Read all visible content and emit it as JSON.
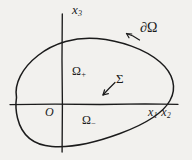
{
  "figure": {
    "kind": "hand-drawn-math-diagram",
    "background_color": "#f2f1ee",
    "ink_color": "#1b1b1b",
    "width": 192,
    "height": 160
  },
  "axes": {
    "vertical": {
      "label": "x",
      "subscript": "3",
      "x": 62,
      "y_top": 14,
      "y_bottom": 152
    },
    "horizontal": {
      "label_a": "x",
      "subscript_a": "1",
      "label_b": "x",
      "subscript_b": "2",
      "y": 104,
      "x_left": 10,
      "x_right": 178
    },
    "origin_label": "O"
  },
  "region": {
    "boundary_label": "∂Ω",
    "upper_label": "Ω",
    "upper_sign": "+",
    "lower_label": "Ω",
    "lower_sign": "−",
    "interface_label": "Σ",
    "ellipse": {
      "cx": 94,
      "cy": 95,
      "rx": 80,
      "ry": 47,
      "rotation_deg": -28
    }
  }
}
